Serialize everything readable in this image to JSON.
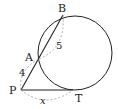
{
  "diagram": {
    "points": [
      {
        "id": "B",
        "label": "B",
        "x": 63,
        "y": 15,
        "lx": 58,
        "ly": 12
      },
      {
        "id": "A",
        "label": "A",
        "x": 39,
        "y": 59,
        "lx": 25,
        "ly": 61
      },
      {
        "id": "P",
        "label": "P",
        "x": 21,
        "y": 90,
        "lx": 9,
        "ly": 94
      },
      {
        "id": "T",
        "label": "T",
        "x": 73,
        "y": 90,
        "lx": 75,
        "ly": 102
      }
    ],
    "circle": {
      "cx": 75,
      "cy": 53,
      "r": 37
    },
    "segment_labels": [
      {
        "id": "AB",
        "text": "5",
        "x": 56,
        "y": 49
      },
      {
        "id": "PA",
        "text": "4",
        "x": 19,
        "y": 76
      },
      {
        "id": "PT",
        "text": "x",
        "x": 40,
        "y": 104
      }
    ],
    "colors": {
      "stroke": "#222222",
      "dashed": "#999999"
    }
  }
}
